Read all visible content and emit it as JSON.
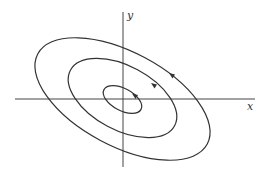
{
  "diagram": {
    "type": "phase portrait",
    "axes": {
      "x_label": "x",
      "y_label": "y",
      "origin": [
        123,
        99
      ]
    },
    "curves": [
      {
        "name": "inner-ellipse",
        "cx": 122.5,
        "cy": 99.5,
        "rx": 21,
        "ry": 11,
        "rotation": 28
      },
      {
        "name": "middle-ellipse",
        "cx": 122.5,
        "cy": 98,
        "rx": 59,
        "ry": 33,
        "rotation": 28
      },
      {
        "name": "outer-ellipse",
        "cx": 122.5,
        "cy": 99,
        "rx": 96,
        "ry": 48,
        "rotation": 28
      }
    ],
    "direction": "counterclockwise",
    "colors": {
      "stroke": "#333333",
      "background": "#ffffff"
    }
  }
}
